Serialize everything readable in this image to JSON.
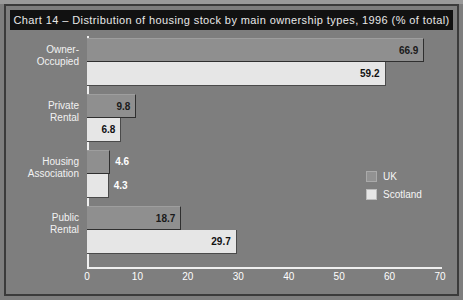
{
  "chart_data": {
    "type": "bar",
    "orientation": "horizontal",
    "title": "Chart 14 – Distribution of housing stock by main ownership types, 1996 (% of total)",
    "categories": [
      "Owner-Occupied",
      "Private Rental",
      "Housing Association",
      "Public Rental"
    ],
    "series": [
      {
        "name": "UK",
        "values": [
          66.9,
          9.8,
          4.6,
          18.7
        ],
        "color": "#8f8f8f"
      },
      {
        "name": "Scotland",
        "values": [
          59.2,
          6.8,
          4.3,
          29.7
        ],
        "color": "#e6e6e6"
      }
    ],
    "xlabel": "",
    "ylabel": "",
    "xlim": [
      0,
      70
    ],
    "xticks": [
      0,
      10,
      20,
      30,
      40,
      50,
      60,
      70
    ],
    "grid": false,
    "legend_position": "middle-right"
  },
  "title": {
    "text": "Chart 14 – Distribution of housing stock by main ownership types, 1996 (% of total)"
  },
  "categories": [
    {
      "line1": "Owner-",
      "line2": "Occupied"
    },
    {
      "line1": "Private",
      "line2": "Rental"
    },
    {
      "line1": "Housing",
      "line2": "Association"
    },
    {
      "line1": "Public",
      "line2": "Rental"
    }
  ],
  "bars": [
    {
      "series": "UK",
      "category": "Owner-Occupied",
      "value": 66.9,
      "label": "66.9"
    },
    {
      "series": "Scotland",
      "category": "Owner-Occupied",
      "value": 59.2,
      "label": "59.2"
    },
    {
      "series": "UK",
      "category": "Private Rental",
      "value": 9.8,
      "label": "9.8"
    },
    {
      "series": "Scotland",
      "category": "Private Rental",
      "value": 6.8,
      "label": "6.8"
    },
    {
      "series": "UK",
      "category": "Housing Association",
      "value": 4.6,
      "label": "4.6"
    },
    {
      "series": "Scotland",
      "category": "Housing Association",
      "value": 4.3,
      "label": "4.3"
    },
    {
      "series": "UK",
      "category": "Public Rental",
      "value": 18.7,
      "label": "18.7"
    },
    {
      "series": "Scotland",
      "category": "Public Rental",
      "value": 29.7,
      "label": "29.7"
    }
  ],
  "xticks": [
    {
      "label": "0"
    },
    {
      "label": "10"
    },
    {
      "label": "20"
    },
    {
      "label": "30"
    },
    {
      "label": "40"
    },
    {
      "label": "50"
    },
    {
      "label": "60"
    },
    {
      "label": "70"
    }
  ],
  "legend": {
    "items": [
      {
        "label": "UK",
        "color": "#8f8f8f"
      },
      {
        "label": "Scotland",
        "color": "#e6e6e6"
      }
    ]
  },
  "colors": {
    "background": "#7e7e7e",
    "title_band": "#111111",
    "axis": "#efefef",
    "uk_bar": "#8f8f8f",
    "scotland_bar": "#e6e6e6"
  }
}
